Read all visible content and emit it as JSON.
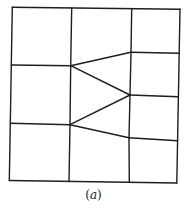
{
  "figure": {
    "caption_open": "(",
    "caption_label": "a",
    "caption_close": ")",
    "stroke_color": "#1e1e1e",
    "nodes": {
      "TL": [
        12.3,
        7.3
      ],
      "T1": [
        71.7,
        8.0
      ],
      "T2": [
        131.7,
        8.7
      ],
      "TR": [
        180.0,
        9.3
      ],
      "L1": [
        11.3,
        65.0
      ],
      "L2": [
        10.3,
        123.3
      ],
      "BL": [
        9.3,
        180.5
      ],
      "B1": [
        69.0,
        181.5
      ],
      "B2": [
        129.3,
        182.3
      ],
      "BR": [
        176.8,
        183.0
      ],
      "R1": [
        178.8,
        53.3
      ],
      "R2": [
        178.2,
        96.7
      ],
      "R3": [
        177.6,
        140.7
      ],
      "A": [
        70.7,
        65.7
      ],
      "B": [
        70.0,
        124.7
      ],
      "C": [
        131.0,
        52.3
      ],
      "D": [
        130.0,
        95.0
      ],
      "E": [
        129.0,
        137.7
      ]
    },
    "lines": [
      {
        "id": "top-edge",
        "from": "TL",
        "to": "TR"
      },
      {
        "id": "bottom-edge",
        "from": "BL",
        "to": "BR"
      },
      {
        "id": "left-edge",
        "from": "TL",
        "to": "BL"
      },
      {
        "id": "right-edge",
        "from": "TR",
        "to": "BR"
      },
      {
        "id": "vertical-1-upper",
        "from": "T1",
        "to": "A"
      },
      {
        "id": "vertical-1-middle",
        "from": "A",
        "to": "B"
      },
      {
        "id": "vertical-1-lower",
        "from": "B",
        "to": "B1"
      },
      {
        "id": "vertical-2-upper",
        "from": "T2",
        "to": "C"
      },
      {
        "id": "vertical-2-a",
        "from": "C",
        "to": "D"
      },
      {
        "id": "vertical-2-b",
        "from": "D",
        "to": "E"
      },
      {
        "id": "vertical-2-lower",
        "from": "E",
        "to": "B2"
      },
      {
        "id": "horizontal-left-1",
        "from": "L1",
        "to": "A"
      },
      {
        "id": "horizontal-left-2",
        "from": "L2",
        "to": "B"
      },
      {
        "id": "horizontal-right-1",
        "from": "C",
        "to": "R1"
      },
      {
        "id": "horizontal-right-2",
        "from": "D",
        "to": "R2"
      },
      {
        "id": "horizontal-right-3",
        "from": "E",
        "to": "R3"
      },
      {
        "id": "diagonal-A-C",
        "from": "A",
        "to": "C"
      },
      {
        "id": "diagonal-A-D",
        "from": "A",
        "to": "D"
      },
      {
        "id": "diagonal-B-D",
        "from": "B",
        "to": "D"
      },
      {
        "id": "diagonal-B-E",
        "from": "B",
        "to": "E"
      }
    ]
  }
}
